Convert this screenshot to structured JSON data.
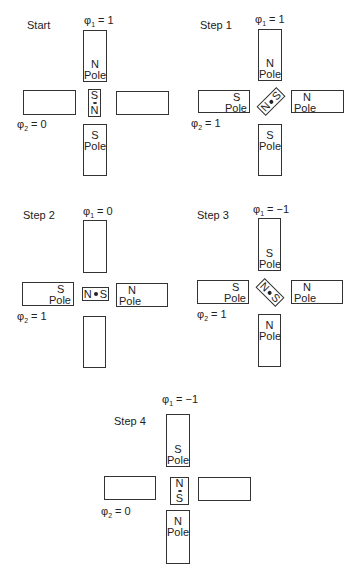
{
  "panels": [
    {
      "title": "Start",
      "phi1": "= 1",
      "phi2": "= 0",
      "top": "N|Pole",
      "bottom": "S|Pole",
      "left": "",
      "right": "",
      "rotor": [
        "S",
        "N"
      ]
    },
    {
      "title": "Step 1",
      "phi1": "= 1",
      "phi2": "= 1",
      "top": "N|Pole",
      "bottom": "S|Pole",
      "left": "S|Pole",
      "right": "N|Pole",
      "rotor": [
        "N",
        "S"
      ]
    },
    {
      "title": "Step 2",
      "phi1": "= 0",
      "phi2": "= 1",
      "top": "",
      "bottom": "",
      "left": "S|Pole",
      "right": "N|Pole",
      "rotor": [
        "N",
        "S"
      ]
    },
    {
      "title": "Step 3",
      "phi1": "= −1",
      "phi2": "= 1",
      "top": "S|Pole",
      "bottom": "N|Pole",
      "left": "S|Pole",
      "right": "N|Pole",
      "rotor": [
        "N",
        "S"
      ]
    },
    {
      "title": "Step 4",
      "phi1": "= −1",
      "phi2": "= 0",
      "top": "S|Pole",
      "bottom": "N|Pole",
      "left": "",
      "right": "",
      "rotor": [
        "N",
        "S"
      ]
    }
  ],
  "symbols": {
    "phi": "φ",
    "sub1": "1",
    "sub2": "2",
    "pole": "Pole",
    "N": "N",
    "S": "S"
  }
}
